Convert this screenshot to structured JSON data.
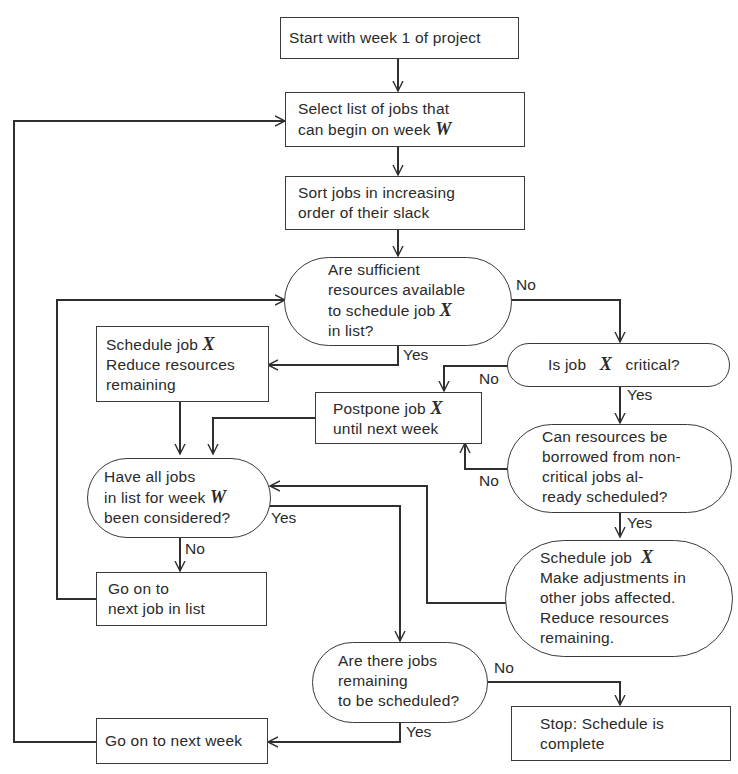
{
  "diagram": {
    "type": "flowchart",
    "title": "",
    "variables": {
      "week": "W",
      "job": "X"
    },
    "nodes": {
      "start": {
        "shape": "rect",
        "lines": [
          "Start with week 1 of project"
        ]
      },
      "select": {
        "shape": "rect",
        "lines": [
          "Select list of jobs that",
          "can begin on week"
        ],
        "var": "W"
      },
      "sort": {
        "shape": "rect",
        "lines": [
          "Sort jobs in increasing",
          "order of their slack"
        ]
      },
      "sufficient": {
        "shape": "decision",
        "lines": [
          "Are sufficient",
          "resources available",
          "to schedule job",
          "in list?"
        ],
        "var": "X"
      },
      "schedule_job": {
        "shape": "rect",
        "lines": [
          "Schedule job",
          "Reduce resources",
          "remaining"
        ],
        "var": "X"
      },
      "critical": {
        "shape": "decision",
        "lines_pre": "Is job",
        "var": "X",
        "lines_post": "critical?"
      },
      "postpone": {
        "shape": "rect",
        "lines": [
          "Postpone job",
          "until next week"
        ],
        "var": "X"
      },
      "borrow": {
        "shape": "decision",
        "lines": [
          "Can resources be",
          "borrowed from non-",
          "critical jobs al-",
          "ready scheduled?"
        ]
      },
      "all_considered": {
        "shape": "decision",
        "lines": [
          "Have all jobs",
          "in list for week",
          "been considered?"
        ],
        "var": "W"
      },
      "schedule_adjust": {
        "shape": "decision",
        "lines": [
          "Schedule job",
          "Make adjustments in",
          "other jobs affected.",
          "Reduce resources",
          "remaining."
        ],
        "var": "X"
      },
      "next_job": {
        "shape": "rect",
        "lines": [
          "Go on to",
          "next job in list"
        ]
      },
      "jobs_remaining": {
        "shape": "decision",
        "lines": [
          "Are there jobs",
          "remaining",
          "to be scheduled?"
        ]
      },
      "next_week": {
        "shape": "rect",
        "lines": [
          "Go on to next week"
        ]
      },
      "stop": {
        "shape": "rect",
        "lines": [
          "Stop: Schedule is",
          "complete"
        ]
      }
    },
    "edge_labels": {
      "sufficient_no": "No",
      "sufficient_yes": "Yes",
      "critical_no": "No",
      "critical_yes": "Yes",
      "borrow_no": "No",
      "borrow_yes": "Yes",
      "all_considered_yes": "Yes",
      "all_considered_no": "No",
      "jobs_remaining_no": "No",
      "jobs_remaining_yes": "Yes"
    },
    "edges": [
      {
        "from": "start",
        "to": "select"
      },
      {
        "from": "select",
        "to": "sort"
      },
      {
        "from": "sort",
        "to": "sufficient"
      },
      {
        "from": "sufficient",
        "to": "critical",
        "label": "No"
      },
      {
        "from": "sufficient",
        "to": "schedule_job",
        "label": "Yes"
      },
      {
        "from": "critical",
        "to": "postpone",
        "label": "No"
      },
      {
        "from": "critical",
        "to": "borrow",
        "label": "Yes"
      },
      {
        "from": "borrow",
        "to": "postpone",
        "label": "No"
      },
      {
        "from": "borrow",
        "to": "schedule_adjust",
        "label": "Yes"
      },
      {
        "from": "schedule_job",
        "to": "all_considered"
      },
      {
        "from": "postpone",
        "to": "all_considered"
      },
      {
        "from": "schedule_adjust",
        "to": "all_considered"
      },
      {
        "from": "all_considered",
        "to": "next_job",
        "label": "No"
      },
      {
        "from": "all_considered",
        "to": "jobs_remaining",
        "label": "Yes"
      },
      {
        "from": "next_job",
        "to": "sufficient"
      },
      {
        "from": "jobs_remaining",
        "to": "stop",
        "label": "No"
      },
      {
        "from": "jobs_remaining",
        "to": "next_week",
        "label": "Yes"
      },
      {
        "from": "next_week",
        "to": "select"
      }
    ]
  }
}
